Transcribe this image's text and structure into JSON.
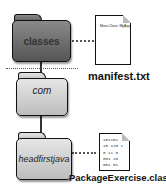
{
  "folders": {
    "classes": "classes",
    "com": "com",
    "headfirstjava": "headfirstjava"
  },
  "files": {
    "manifest": {
      "name": "manifest.txt",
      "content": "Main-Class: MyApp"
    },
    "classfile": {
      "name": "PackageExercise.class",
      "lines": [
        "101101",
        "10 110 1",
        "0 11 0",
        "001 10",
        "001 01"
      ]
    }
  }
}
